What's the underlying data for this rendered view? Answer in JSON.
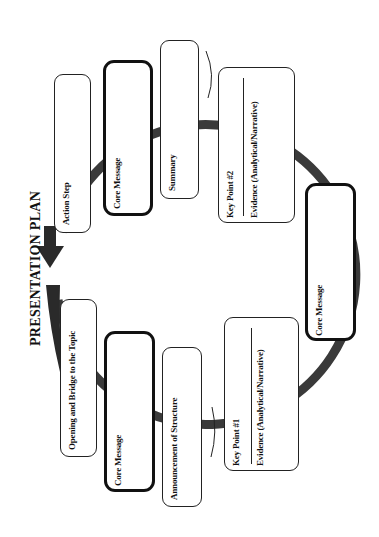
{
  "title": "PRESENTATION PLAN",
  "orientation": "rotated -90deg (page turned counter-clockwise)",
  "colors": {
    "ring": "#3a3a3a",
    "box_border": "#222222",
    "background": "#ffffff"
  },
  "steps": [
    {
      "id": "opening",
      "label": "Opening and Bridge to the Topic",
      "emphasis": false
    },
    {
      "id": "core1",
      "label": "Core Message",
      "emphasis": true
    },
    {
      "id": "announcement",
      "label": "Announcement of Structure",
      "emphasis": false
    },
    {
      "id": "keypoint1",
      "label": "Key Point #1",
      "sublabel": "Evidence (Analytical/Narrative)",
      "emphasis": false
    },
    {
      "id": "core2",
      "label": "Core Message",
      "emphasis": true
    },
    {
      "id": "keypoint2",
      "label": "Key Point #2",
      "sublabel": "Evidence (Analytical/Narrative)",
      "emphasis": false
    },
    {
      "id": "summary",
      "label": "Summary",
      "emphasis": false
    },
    {
      "id": "core3",
      "label": "Core Message",
      "emphasis": true
    },
    {
      "id": "action",
      "label": "Action Step",
      "emphasis": false
    }
  ]
}
